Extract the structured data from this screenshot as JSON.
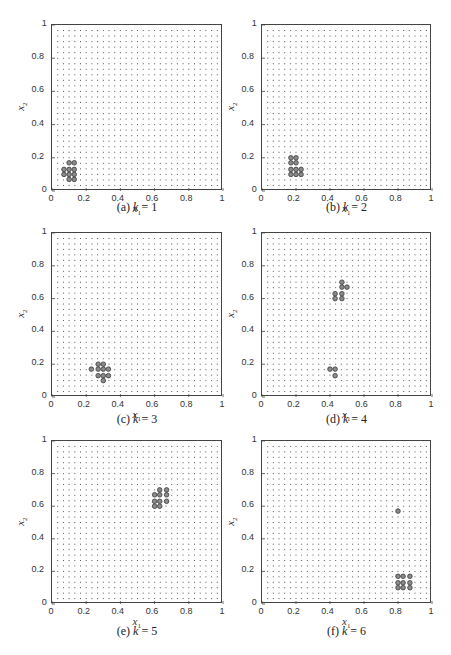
{
  "chart_data": [
    {
      "type": "scatter",
      "panel": "a",
      "caption_prefix": "(a)",
      "caption_k": "k = 1",
      "xlabel": "x1",
      "ylabel": "x2",
      "xlim": [
        0,
        1
      ],
      "ylim": [
        0,
        1
      ],
      "xticks": [
        "0",
        "0.2",
        "0.4",
        "0.6",
        "0.8",
        "1"
      ],
      "yticks": [
        "0",
        "0.2",
        "0.4",
        "0.6",
        "0.8",
        "1"
      ],
      "grid_spacing": 0.0333,
      "background_grid": "dotted points at 1/30 spacing",
      "highlighted_points": [
        [
          0.1,
          0.17
        ],
        [
          0.13,
          0.17
        ],
        [
          0.07,
          0.13
        ],
        [
          0.1,
          0.13
        ],
        [
          0.13,
          0.13
        ],
        [
          0.07,
          0.1
        ],
        [
          0.1,
          0.1
        ],
        [
          0.13,
          0.1
        ],
        [
          0.1,
          0.07
        ],
        [
          0.13,
          0.07
        ]
      ]
    },
    {
      "type": "scatter",
      "panel": "b",
      "caption_prefix": "(b)",
      "caption_k": "k = 2",
      "xlabel": "x1",
      "ylabel": "x2",
      "xlim": [
        0,
        1
      ],
      "ylim": [
        0,
        1
      ],
      "xticks": [
        "0",
        "0.2",
        "0.4",
        "0.6",
        "0.8",
        "1"
      ],
      "yticks": [
        "0",
        "0.2",
        "0.4",
        "0.6",
        "0.8",
        "1"
      ],
      "grid_spacing": 0.0333,
      "highlighted_points": [
        [
          0.17,
          0.2
        ],
        [
          0.2,
          0.2
        ],
        [
          0.17,
          0.17
        ],
        [
          0.2,
          0.17
        ],
        [
          0.17,
          0.13
        ],
        [
          0.2,
          0.13
        ],
        [
          0.23,
          0.13
        ],
        [
          0.17,
          0.1
        ],
        [
          0.2,
          0.1
        ],
        [
          0.23,
          0.1
        ]
      ]
    },
    {
      "type": "scatter",
      "panel": "c",
      "caption_prefix": "(c)",
      "caption_k": "k = 3",
      "xlabel": "x1",
      "ylabel": "x2",
      "xlim": [
        0,
        1
      ],
      "ylim": [
        0,
        1
      ],
      "xticks": [
        "0",
        "0.2",
        "0.4",
        "0.6",
        "0.8",
        "1"
      ],
      "yticks": [
        "0",
        "0.2",
        "0.4",
        "0.6",
        "0.8",
        "1"
      ],
      "grid_spacing": 0.0333,
      "highlighted_points": [
        [
          0.27,
          0.2
        ],
        [
          0.3,
          0.2
        ],
        [
          0.23,
          0.17
        ],
        [
          0.27,
          0.17
        ],
        [
          0.3,
          0.17
        ],
        [
          0.33,
          0.17
        ],
        [
          0.27,
          0.13
        ],
        [
          0.3,
          0.13
        ],
        [
          0.33,
          0.13
        ],
        [
          0.3,
          0.1
        ]
      ]
    },
    {
      "type": "scatter",
      "panel": "d",
      "caption_prefix": "(d)",
      "caption_k": "k = 4",
      "xlabel": "x1",
      "ylabel": "x2",
      "xlim": [
        0,
        1
      ],
      "ylim": [
        0,
        1
      ],
      "xticks": [
        "0",
        "0.2",
        "0.4",
        "0.6",
        "0.8",
        "1"
      ],
      "yticks": [
        "0",
        "0.2",
        "0.4",
        "0.6",
        "0.8",
        "1"
      ],
      "grid_spacing": 0.0333,
      "highlighted_points": [
        [
          0.47,
          0.7
        ],
        [
          0.47,
          0.67
        ],
        [
          0.5,
          0.67
        ],
        [
          0.43,
          0.63
        ],
        [
          0.47,
          0.63
        ],
        [
          0.43,
          0.6
        ],
        [
          0.47,
          0.6
        ],
        [
          0.4,
          0.17
        ],
        [
          0.43,
          0.17
        ],
        [
          0.43,
          0.13
        ]
      ]
    },
    {
      "type": "scatter",
      "panel": "e",
      "caption_prefix": "(e)",
      "caption_k": "k = 5",
      "xlabel": "x1",
      "ylabel": "x2",
      "xlim": [
        0,
        1
      ],
      "ylim": [
        0,
        1
      ],
      "xticks": [
        "0",
        "0.2",
        "0.4",
        "0.6",
        "0.8",
        "1"
      ],
      "yticks": [
        "0",
        "0.2",
        "0.4",
        "0.6",
        "0.8",
        "1"
      ],
      "grid_spacing": 0.0333,
      "highlighted_points": [
        [
          0.63,
          0.7
        ],
        [
          0.67,
          0.7
        ],
        [
          0.6,
          0.67
        ],
        [
          0.63,
          0.67
        ],
        [
          0.67,
          0.67
        ],
        [
          0.6,
          0.63
        ],
        [
          0.63,
          0.63
        ],
        [
          0.67,
          0.63
        ],
        [
          0.6,
          0.6
        ],
        [
          0.63,
          0.6
        ]
      ]
    },
    {
      "type": "scatter",
      "panel": "f",
      "caption_prefix": "(f)",
      "caption_k": "k = 6",
      "xlabel": "x1",
      "ylabel": "x2",
      "xlim": [
        0,
        1
      ],
      "ylim": [
        0,
        1
      ],
      "xticks": [
        "0",
        "0.2",
        "0.4",
        "0.6",
        "0.8",
        "1"
      ],
      "yticks": [
        "0",
        "0.2",
        "0.4",
        "0.6",
        "0.8",
        "1"
      ],
      "grid_spacing": 0.0333,
      "highlighted_points": [
        [
          0.8,
          0.57
        ],
        [
          0.8,
          0.17
        ],
        [
          0.83,
          0.17
        ],
        [
          0.87,
          0.17
        ],
        [
          0.8,
          0.13
        ],
        [
          0.83,
          0.13
        ],
        [
          0.87,
          0.13
        ],
        [
          0.8,
          0.1
        ],
        [
          0.83,
          0.1
        ],
        [
          0.87,
          0.1
        ]
      ]
    }
  ],
  "colors": {
    "grid_dot": "#555555",
    "highlight_fill": "#8a8a8a",
    "highlight_stroke": "#3a3a3a",
    "axis": "#444444"
  }
}
